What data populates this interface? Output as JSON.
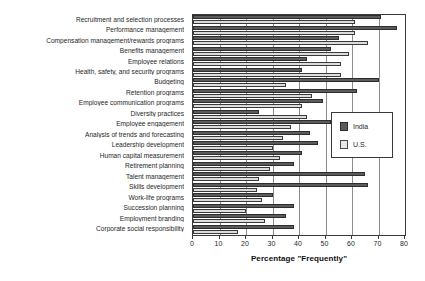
{
  "chart_data": {
    "type": "bar",
    "orientation": "horizontal",
    "title": "",
    "xlabel": "Percentage \"Frequently\"",
    "ylabel": "",
    "xlim": [
      0,
      80
    ],
    "xticks": [
      0,
      10,
      20,
      30,
      40,
      50,
      60,
      70,
      80
    ],
    "grid": true,
    "legend_position": "right-middle",
    "colors": {
      "india": "#5b5b5b",
      "us": "#dcdcdc",
      "axis": "#3a3a3a",
      "grid": "#8c8c8c",
      "background": "#ffffff"
    },
    "categories": [
      "Recruitment and selection processes",
      "Performance management",
      "Compensation management/rewards programs",
      "Benefits management",
      "Employee relations",
      "Health, safety, and security programs",
      "Budgeting",
      "Retention programs",
      "Employee communication programs",
      "Diversity practices",
      "Employee engagement",
      "Analysis of trends and forecasting",
      "Leadership development",
      "Human capital measurement",
      "Retirement planning",
      "Talent management",
      "Skills development",
      "Work-life programs",
      "Succession planning",
      "Employment branding",
      "Corporate social responsibility"
    ],
    "series": [
      {
        "name": "India",
        "color": "#5b5b5b",
        "values": [
          71,
          77,
          55,
          52,
          43,
          41,
          70,
          62,
          49,
          25,
          52,
          44,
          47,
          41,
          38,
          65,
          66,
          30,
          38,
          35,
          38
        ]
      },
      {
        "name": "U.S.",
        "color": "#dcdcdc",
        "values": [
          61,
          61,
          66,
          59,
          56,
          56,
          35,
          45,
          41,
          43,
          37,
          34,
          30,
          33,
          29,
          25,
          24,
          26,
          20,
          27,
          17
        ]
      }
    ]
  },
  "legend": {
    "items": [
      {
        "label": "India"
      },
      {
        "label": "U.S."
      }
    ]
  }
}
